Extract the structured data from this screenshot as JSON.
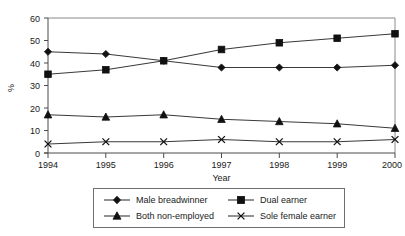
{
  "chart_data": {
    "type": "line",
    "title": "",
    "xlabel": "Year",
    "ylabel": "%",
    "categories": [
      "1994",
      "1995",
      "1996",
      "1997",
      "1998",
      "1999",
      "2000"
    ],
    "x": [
      1994,
      1995,
      1996,
      1997,
      1998,
      1999,
      2000
    ],
    "xlim": [
      1994,
      2000
    ],
    "ylim": [
      0,
      60
    ],
    "yticks": [
      0,
      10,
      20,
      30,
      40,
      50,
      60
    ],
    "ytick_labels": [
      "0",
      "10",
      "20",
      "30",
      "40",
      "50",
      "60"
    ],
    "grid": false,
    "legend_position": "bottom",
    "series": [
      {
        "name": "Male breadwinner",
        "marker": "diamond",
        "color": "#111111",
        "values": [
          45,
          44,
          41,
          38,
          38,
          38,
          39
        ]
      },
      {
        "name": "Dual earner",
        "marker": "square",
        "color": "#111111",
        "values": [
          35,
          37,
          41,
          46,
          49,
          51,
          53
        ]
      },
      {
        "name": "Both non-employed",
        "marker": "triangle",
        "color": "#111111",
        "values": [
          17,
          16,
          17,
          15,
          14,
          13,
          11
        ]
      },
      {
        "name": "Sole female earner",
        "marker": "cross-x",
        "color": "#111111",
        "values": [
          4,
          5,
          5,
          6,
          5,
          5,
          6
        ]
      }
    ]
  },
  "axes": {
    "y_label": "%",
    "x_label": "Year"
  },
  "legend": {
    "entries": [
      {
        "label": "Male breadwinner",
        "marker": "diamond"
      },
      {
        "label": "Dual earner",
        "marker": "square"
      },
      {
        "label": "Both non-employed",
        "marker": "triangle"
      },
      {
        "label": "Sole female earner",
        "marker": "cross-x"
      }
    ]
  }
}
